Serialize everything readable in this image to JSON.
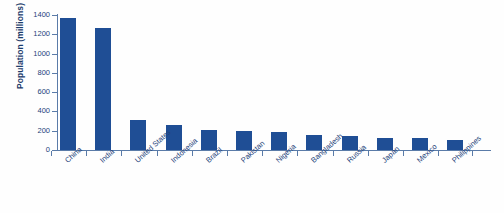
{
  "chart_data": {
    "type": "bar",
    "title": "",
    "xlabel": "",
    "ylabel": "Population (millions)",
    "categories": [
      "China",
      "India",
      "United States",
      "Indonesia",
      "Brazil",
      "Pakistan",
      "Nigeria",
      "Bangladesh",
      "Russia",
      "Japan",
      "Mexico",
      "Philippines"
    ],
    "values": [
      1365,
      1270,
      310,
      255,
      205,
      195,
      185,
      160,
      145,
      127,
      122,
      100
    ],
    "ylim": [
      0,
      1400
    ],
    "ytick_labels": [
      "1400",
      "1200",
      "1000",
      "800",
      "600",
      "400",
      "200",
      "0"
    ],
    "ytick_values": [
      1400,
      1200,
      1000,
      800,
      600,
      400,
      200,
      0
    ],
    "grid": false,
    "legend": null,
    "bar_color": "#1f4e95",
    "axis_color": "#5a7ba8",
    "text_color": "#24427a"
  }
}
